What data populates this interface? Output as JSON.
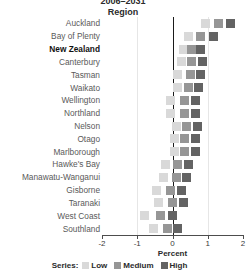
{
  "title": {
    "line1": "2006–2031",
    "subtitle": "Region"
  },
  "legend": {
    "title": "Series:",
    "items": [
      {
        "label": "Low",
        "color": "#d9d9d9"
      },
      {
        "label": "Medium",
        "color": "#969696"
      },
      {
        "label": "High",
        "color": "#636363"
      }
    ]
  },
  "axis": {
    "xlabel": "Percent",
    "ticks": [
      "-2",
      "-1",
      "0",
      "1",
      "2"
    ]
  },
  "chart_data": {
    "type": "scatter",
    "title": "2006–2031",
    "subtitle": "Region",
    "xlabel": "Percent",
    "ylabel": "Region",
    "xlim": [
      -2,
      2
    ],
    "xticks": [
      -2,
      -1,
      0,
      1,
      2
    ],
    "grid": "vertical gridlines at -1, 0, 1; bold zero reference line at 0",
    "legend_position": "bottom-center",
    "legend_title": "Series:",
    "categories": [
      "Auckland",
      "Bay of Plenty",
      "New Zealand",
      "Canterbury",
      "Tasman",
      "Waikato",
      "Wellington",
      "Northland",
      "Nelson",
      "Otago",
      "Marlborough",
      "Hawke's Bay",
      "Manawatu-Wanganui",
      "Gisborne",
      "Taranaki",
      "West Coast",
      "Southland"
    ],
    "highlight_category": "New Zealand",
    "series": [
      {
        "name": "Low",
        "color": "#d9d9d9",
        "values": [
          0.95,
          0.45,
          0.3,
          0.25,
          0.15,
          0.15,
          -0.05,
          -0.05,
          0.1,
          0.05,
          0.05,
          -0.2,
          -0.25,
          -0.45,
          -0.4,
          -0.8,
          -0.55
        ]
      },
      {
        "name": "Medium",
        "color": "#969696",
        "values": [
          1.3,
          0.8,
          0.55,
          0.55,
          0.5,
          0.45,
          0.35,
          0.35,
          0.4,
          0.35,
          0.35,
          0.15,
          0.1,
          -0.05,
          0.0,
          -0.35,
          -0.15
        ]
      },
      {
        "name": "High",
        "color": "#636363",
        "values": [
          1.65,
          1.15,
          0.8,
          0.85,
          0.8,
          0.75,
          0.65,
          0.65,
          0.7,
          0.65,
          0.65,
          0.45,
          0.4,
          0.25,
          0.3,
          0.0,
          0.15
        ]
      }
    ]
  }
}
